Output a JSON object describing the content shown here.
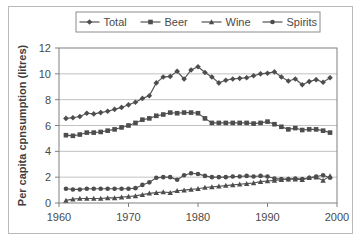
{
  "chart_data": {
    "type": "line",
    "title": "",
    "xlabel": "",
    "ylabel": "Per capita cpnsumption (litres)",
    "xlim": [
      1960,
      2000
    ],
    "ylim": [
      0,
      12
    ],
    "xticks": [
      1960,
      1970,
      1980,
      1990,
      2000
    ],
    "yticks": [
      0,
      2,
      4,
      6,
      8,
      10,
      12
    ],
    "grid": "horizontal",
    "legend_position": "top-center",
    "x": [
      1961,
      1962,
      1963,
      1964,
      1965,
      1966,
      1967,
      1968,
      1969,
      1970,
      1971,
      1972,
      1973,
      1974,
      1975,
      1976,
      1977,
      1978,
      1979,
      1980,
      1981,
      1982,
      1983,
      1984,
      1985,
      1986,
      1987,
      1988,
      1989,
      1990,
      1991,
      1992,
      1993,
      1994,
      1995,
      1996,
      1997,
      1998,
      1999
    ],
    "series": [
      {
        "name": "Total",
        "marker": "diamond",
        "color": "#4d4d4d",
        "values": [
          6.55,
          6.6,
          6.7,
          6.95,
          6.9,
          7.0,
          7.1,
          7.25,
          7.4,
          7.6,
          7.8,
          8.1,
          8.3,
          9.3,
          9.75,
          9.8,
          10.2,
          9.6,
          10.3,
          10.55,
          10.1,
          9.75,
          9.3,
          9.5,
          9.6,
          9.65,
          9.7,
          9.85,
          10.0,
          10.05,
          10.15,
          9.75,
          9.45,
          9.6,
          9.15,
          9.4,
          9.55,
          9.35,
          9.7
        ]
      },
      {
        "name": "Beer",
        "marker": "square",
        "color": "#4d4d4d",
        "values": [
          5.25,
          5.2,
          5.3,
          5.45,
          5.45,
          5.5,
          5.6,
          5.7,
          5.85,
          6.0,
          6.2,
          6.45,
          6.55,
          6.75,
          6.85,
          7.0,
          6.95,
          7.0,
          7.0,
          6.95,
          6.55,
          6.2,
          6.2,
          6.2,
          6.2,
          6.2,
          6.2,
          6.15,
          6.2,
          6.3,
          6.1,
          5.9,
          5.7,
          5.8,
          5.65,
          5.7,
          5.7,
          5.6,
          5.45
        ]
      },
      {
        "name": "Wine",
        "marker": "triangle",
        "color": "#4d4d4d",
        "values": [
          0.2,
          0.3,
          0.35,
          0.35,
          0.35,
          0.35,
          0.4,
          0.4,
          0.45,
          0.5,
          0.55,
          0.65,
          0.75,
          0.8,
          0.85,
          0.8,
          0.95,
          1.0,
          1.05,
          1.1,
          1.2,
          1.25,
          1.3,
          1.35,
          1.4,
          1.45,
          1.5,
          1.55,
          1.65,
          1.7,
          1.75,
          1.8,
          1.85,
          1.85,
          1.8,
          1.95,
          2.0,
          1.75,
          2.1
        ]
      },
      {
        "name": "Spirits",
        "marker": "circle",
        "color": "#4d4d4d",
        "values": [
          1.1,
          1.05,
          1.05,
          1.1,
          1.1,
          1.1,
          1.1,
          1.1,
          1.1,
          1.1,
          1.15,
          1.4,
          1.6,
          1.95,
          2.0,
          2.0,
          1.8,
          2.15,
          2.3,
          2.25,
          2.1,
          2.0,
          2.0,
          2.0,
          2.05,
          2.05,
          2.1,
          2.05,
          2.1,
          2.05,
          1.9,
          1.85,
          1.85,
          1.9,
          1.85,
          1.95,
          2.05,
          2.15,
          1.95
        ]
      }
    ]
  },
  "legend": {
    "items": [
      {
        "label": "Total",
        "marker": "diamond"
      },
      {
        "label": "Beer",
        "marker": "square"
      },
      {
        "label": "Wine",
        "marker": "triangle"
      },
      {
        "label": "Spirits",
        "marker": "circle"
      }
    ]
  }
}
